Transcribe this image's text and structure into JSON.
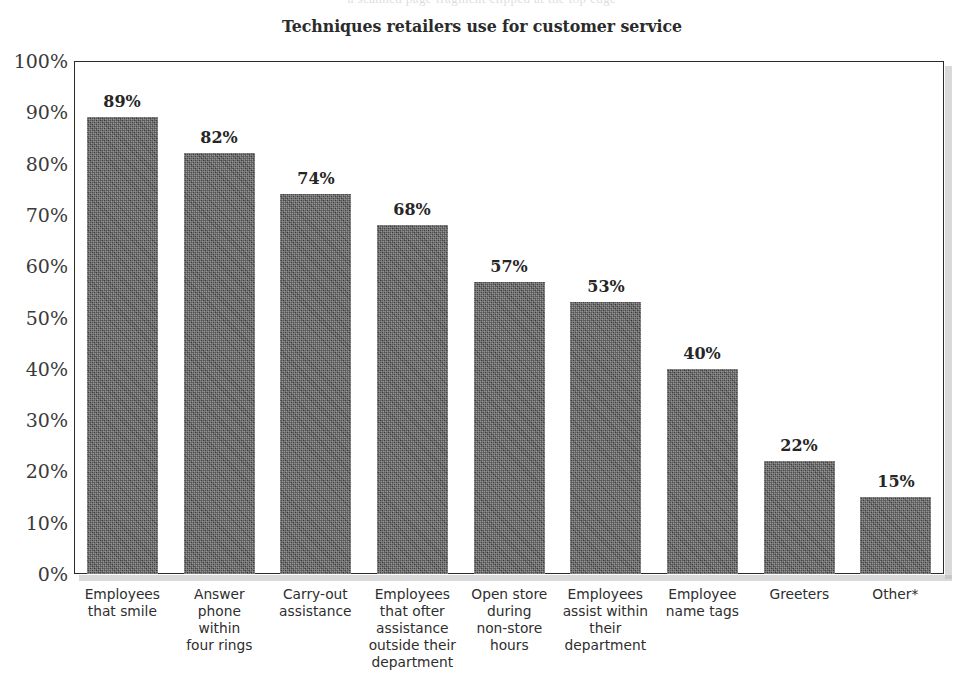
{
  "page": {
    "background_color": "#ffffff",
    "clipped_top_text": "a scanned page fragment clipped at the top edge"
  },
  "chart_data": {
    "type": "bar",
    "title": "Techniques retailers use for customer service",
    "xlabel": "",
    "ylabel": "",
    "ylim": [
      0,
      100
    ],
    "grid": false,
    "legend": "none",
    "value_labels": true,
    "bar_color": "#4b4b4b",
    "frame_color": "#2a2a2a",
    "categories": [
      "Employees\nthat smile",
      "Answer\nphone\nwithin\nfour rings",
      "Carry-out\nassistance",
      "Employees\nthat ofter\nassistance\noutside their\ndepartment",
      "Open store\nduring\nnon-store\nhours",
      "Employees\nassist within\ntheir\ndepartment",
      "Employee\nname tags",
      "Greeters",
      "Other*"
    ],
    "values": [
      89,
      82,
      74,
      68,
      57,
      53,
      40,
      22,
      15
    ],
    "value_label_texts": [
      "89%",
      "82%",
      "74%",
      "68%",
      "57%",
      "53%",
      "40%",
      "22%",
      "15%"
    ],
    "y_ticks": [
      0,
      10,
      20,
      30,
      40,
      50,
      60,
      70,
      80,
      90,
      100
    ],
    "y_tick_labels": [
      "0%",
      "10%",
      "20%",
      "30%",
      "40%",
      "50%",
      "60%",
      "70%",
      "80%",
      "90%",
      "100%"
    ]
  }
}
